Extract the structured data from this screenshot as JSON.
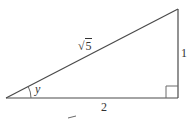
{
  "figure": {
    "type": "right-triangle",
    "vertices": {
      "angle_vertex": [
        6,
        98
      ],
      "right_angle_vertex": [
        178,
        98
      ],
      "top_vertex": [
        178,
        9
      ]
    },
    "labels": {
      "hypotenuse_symbol": "√",
      "hypotenuse_radicand": "5",
      "opposite_side": "1",
      "adjacent_side": "2",
      "angle": "y"
    },
    "colors": {
      "stroke": "#4a4a4a",
      "text": "#333333",
      "background": "#ffffff"
    }
  }
}
